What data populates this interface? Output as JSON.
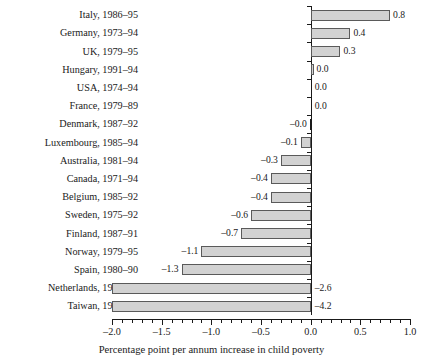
{
  "chart_data": {
    "type": "bar",
    "orientation": "horizontal",
    "title": "",
    "xlabel": "Percentage point per annum increase in child poverty",
    "ylabel": "",
    "xlim": [
      -2.0,
      1.0
    ],
    "xticks": [
      -2.0,
      -1.5,
      -1.0,
      -0.5,
      0.0,
      0.5,
      1.0
    ],
    "xticklabels": [
      "–2.0",
      "–1.5",
      "–1.0",
      "–0.5",
      "0.0",
      "0.5",
      "1.0"
    ],
    "minor_tick_step": 0.1,
    "grid": false,
    "legend": null,
    "bar_fill_color": "#d2d2d2",
    "bar_edge_color": "#5a5a5a",
    "axis_color": "#1a1a1a",
    "categories": [
      "Italy, 1986–95",
      "Germany, 1973–94",
      "UK, 1979–95",
      "Hungary, 1991–94",
      "USA, 1974–94",
      "France, 1979–89",
      "Denmark, 1987–92",
      "Luxembourg, 1985–94",
      "Australia, 1981–94",
      "Canada, 1971–94",
      "Belgium, 1985–92",
      "Sweden, 1975–92",
      "Finland, 1987–91",
      "Norway, 1979–95",
      "Spain, 1980–90",
      "Netherlands, 1983–91",
      "Taiwan, 1986–95"
    ],
    "values": [
      0.8,
      0.4,
      0.3,
      0.03,
      0.01,
      0.0,
      -0.01,
      -0.1,
      -0.3,
      -0.4,
      -0.4,
      -0.6,
      -0.7,
      -1.1,
      -1.3,
      -2.6,
      -4.2
    ],
    "data_labels": [
      "0.8",
      "0.4",
      "0.3",
      "0.0",
      "0.0",
      "0.0",
      "–0.0",
      "–0.1",
      "–0.3",
      "–0.4",
      "–0.4",
      "–0.6",
      "–0.7",
      "–1.1",
      "–1.3",
      "–2.6",
      "–4.2"
    ]
  }
}
